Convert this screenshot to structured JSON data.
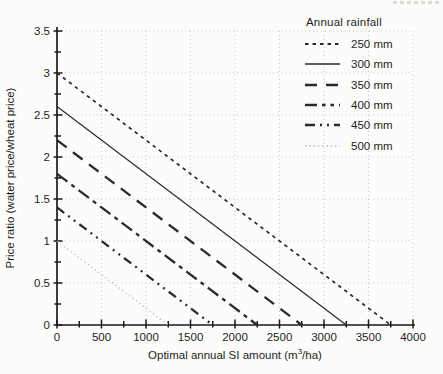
{
  "page_background": "#fcfcfa",
  "ink_color": "#262626",
  "grid_color": "#c9c9c6",
  "axis_color": "#1a1a1a",
  "chart_data": {
    "type": "line",
    "title": "",
    "xlabel": "Optimal annual SI amount (m³/ha)",
    "xlabel_parts": {
      "pre": "Optimal annual SI amount (m",
      "sup": "3",
      "post": "/ha)"
    },
    "ylabel": "Price ratio (water price/wheat price)",
    "xlim": [
      0,
      4000
    ],
    "ylim": [
      0,
      3.5
    ],
    "x_major_step": 500,
    "x_minor_step": 250,
    "y_major_step": 0.5,
    "y_minor_step": 0.25,
    "x_tick_labels": [
      "0",
      "500",
      "1000",
      "1500",
      "2000",
      "2500",
      "3000",
      "3500",
      "4000"
    ],
    "y_tick_labels": [
      "0",
      "0.5",
      "1",
      "1.5",
      "2",
      "2.5",
      "3",
      "3.5"
    ],
    "grid": "dotted lines at every major tick, both axes",
    "legend_title": "Annual rainfall",
    "legend_position": "top-right, outside plot",
    "series": [
      {
        "name": "250 mm",
        "points": [
          [
            0,
            3.0
          ],
          [
            3750,
            0
          ]
        ],
        "color": "#2a2a2a",
        "width": 1.7,
        "dash": "3.5 4",
        "legend_dash": "3.5 4"
      },
      {
        "name": "300 mm",
        "points": [
          [
            0,
            2.6
          ],
          [
            3250,
            0
          ]
        ],
        "color": "#2a2a2a",
        "width": 1.2,
        "dash": "",
        "legend_dash": ""
      },
      {
        "name": "350 mm",
        "points": [
          [
            0,
            2.2
          ],
          [
            2750,
            0
          ]
        ],
        "color": "#2a2a2a",
        "width": 2.3,
        "dash": "12 8",
        "legend_dash": "12 9"
      },
      {
        "name": "400 mm",
        "points": [
          [
            0,
            1.8
          ],
          [
            2250,
            0
          ]
        ],
        "color": "#2a2a2a",
        "width": 2.3,
        "dash": "13 5 4 5",
        "legend_dash": "12 5 3.5 5 3.5 5"
      },
      {
        "name": "450 mm",
        "points": [
          [
            0,
            1.4
          ],
          [
            1750,
            0
          ]
        ],
        "color": "#2a2a2a",
        "width": 2.3,
        "dash": "9 5 2 5 2 5",
        "legend_dash": "10 5 2 5 2 5"
      },
      {
        "name": "500 mm",
        "points": [
          [
            0,
            1.0
          ],
          [
            1250,
            0
          ]
        ],
        "color": "#b4b4b1",
        "width": 1.1,
        "dash": "1.3 3",
        "legend_dash": "1.3 3"
      }
    ]
  }
}
